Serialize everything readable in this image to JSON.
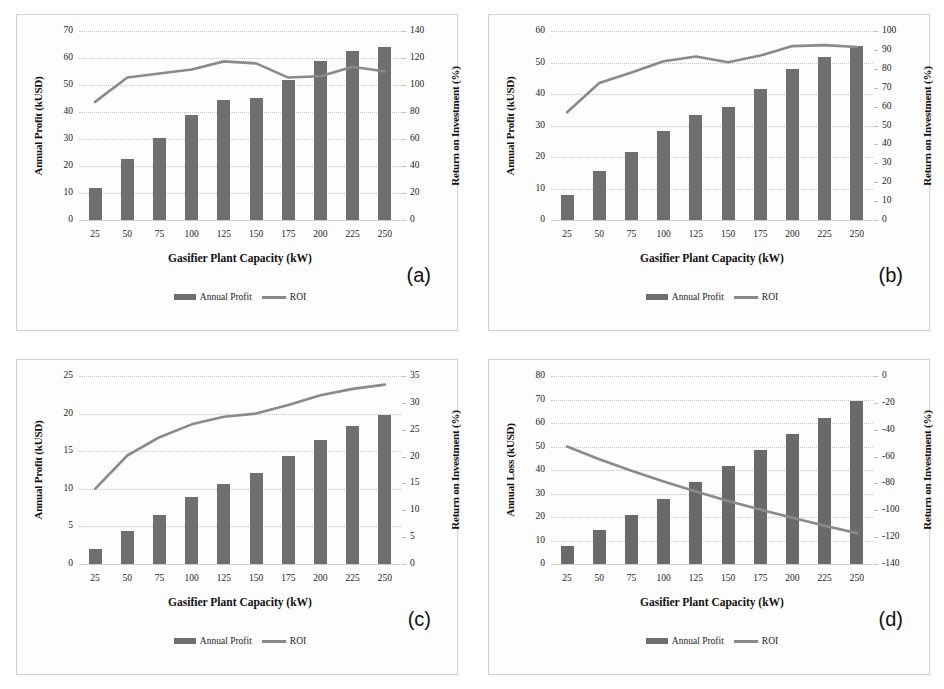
{
  "figure": {
    "categories": [
      "25",
      "50",
      "75",
      "100",
      "125",
      "150",
      "175",
      "200",
      "225",
      "250"
    ],
    "xlabel": "Gasifier Plant Capacity (kW)",
    "legend": {
      "bar": "Annual Profit",
      "line": "ROI"
    }
  },
  "chart_data": [
    {
      "type": "bar",
      "tag": "(a)",
      "title": "",
      "xlabel": "Gasifier Plant Capacity (kW)",
      "ylabel": "Annual Profit (kUSD)",
      "y2label": "Return on Investment (%)",
      "categories": [
        "25",
        "50",
        "75",
        "100",
        "125",
        "150",
        "175",
        "200",
        "225",
        "250"
      ],
      "ylim": [
        0,
        70
      ],
      "yticks": [
        "0",
        "10",
        "20",
        "30",
        "40",
        "50",
        "60",
        "70"
      ],
      "y2lim": [
        0,
        140
      ],
      "y2ticks": [
        "0",
        "20",
        "40",
        "60",
        "80",
        "100",
        "120",
        "140"
      ],
      "grid": true,
      "legend_position": "bottom-center",
      "series": [
        {
          "name": "Annual Profit",
          "kind": "bar",
          "axis": "left",
          "values": [
            12.0,
            22.5,
            30.5,
            39.0,
            44.5,
            45.3,
            52.0,
            59.0,
            62.6,
            64.0
          ]
        },
        {
          "name": "ROI",
          "kind": "line",
          "axis": "right",
          "values": [
            87.5,
            105.5,
            108.5,
            111.5,
            117.5,
            116.0,
            105.5,
            106.5,
            113.5,
            110.0
          ]
        }
      ]
    },
    {
      "type": "bar",
      "tag": "(b)",
      "title": "",
      "xlabel": "Gasifier Plant Capacity (kW)",
      "ylabel": "Annual Profit (kUSD)",
      "y2label": "Return on Investment (%)",
      "categories": [
        "25",
        "50",
        "75",
        "100",
        "125",
        "150",
        "175",
        "200",
        "225",
        "250"
      ],
      "ylim": [
        0,
        60
      ],
      "yticks": [
        "0",
        "10",
        "20",
        "30",
        "40",
        "50",
        "60"
      ],
      "y2lim": [
        0,
        100
      ],
      "y2ticks": [
        "0",
        "10",
        "20",
        "30",
        "40",
        "50",
        "60",
        "70",
        "80",
        "90",
        "100"
      ],
      "grid": true,
      "legend_position": "bottom-center",
      "series": [
        {
          "name": "Annual Profit",
          "kind": "bar",
          "axis": "left",
          "values": [
            8.0,
            15.5,
            21.5,
            28.3,
            33.2,
            36.0,
            41.5,
            47.8,
            51.6,
            55.2
          ]
        },
        {
          "name": "ROI",
          "kind": "line",
          "axis": "right",
          "values": [
            57.0,
            72.5,
            78.0,
            84.0,
            86.5,
            83.5,
            87.0,
            92.0,
            92.5,
            91.5
          ]
        }
      ]
    },
    {
      "type": "bar",
      "tag": "(c)",
      "title": "",
      "xlabel": "Gasifier Plant Capacity (kW)",
      "ylabel": "Annual Profit (kUSD)",
      "y2label": "Return on Investment (%)",
      "categories": [
        "25",
        "50",
        "75",
        "100",
        "125",
        "150",
        "175",
        "200",
        "225",
        "250"
      ],
      "ylim": [
        0,
        25
      ],
      "yticks": [
        "0",
        "5",
        "10",
        "15",
        "20",
        "25"
      ],
      "y2lim": [
        0,
        35
      ],
      "y2ticks": [
        "0",
        "5",
        "10",
        "15",
        "20",
        "25",
        "30",
        "35"
      ],
      "grid": true,
      "legend_position": "bottom-center",
      "series": [
        {
          "name": "Annual Profit",
          "kind": "bar",
          "axis": "left",
          "values": [
            2.0,
            4.4,
            6.5,
            8.9,
            10.7,
            12.1,
            14.3,
            16.5,
            18.4,
            19.8
          ]
        },
        {
          "name": "ROI",
          "kind": "line",
          "axis": "right",
          "values": [
            14.0,
            20.2,
            23.6,
            26.0,
            27.4,
            28.0,
            29.6,
            31.4,
            32.6,
            33.4
          ]
        }
      ]
    },
    {
      "type": "bar",
      "tag": "(d)",
      "title": "",
      "xlabel": "Gasifier Plant Capacity (kW)",
      "ylabel": "Annual Loss (kUSD)",
      "y2label": "Return on Investment (%)",
      "categories": [
        "25",
        "50",
        "75",
        "100",
        "125",
        "150",
        "175",
        "200",
        "225",
        "250"
      ],
      "ylim": [
        0,
        80
      ],
      "yticks": [
        "0",
        "10",
        "20",
        "30",
        "40",
        "50",
        "60",
        "70",
        "80"
      ],
      "y2lim": [
        -140,
        0
      ],
      "y2ticks": [
        "-140",
        "-120",
        "-100",
        "-80",
        "-60",
        "-40",
        "-20",
        "0"
      ],
      "grid": true,
      "legend_position": "bottom-center",
      "series": [
        {
          "name": "Annual Profit",
          "kind": "bar",
          "axis": "left",
          "values": [
            7.5,
            14.3,
            21.0,
            27.8,
            34.7,
            41.6,
            48.5,
            55.2,
            62.3,
            69.4
          ]
        },
        {
          "name": "ROI",
          "kind": "line",
          "axis": "right",
          "values": [
            -52.5,
            -62.0,
            -70.5,
            -78.5,
            -86.0,
            -93.0,
            -99.5,
            -105.5,
            -111.5,
            -117.0
          ]
        }
      ]
    }
  ],
  "colors": {
    "bar": "#6f6f6f",
    "line": "#8a8a8a",
    "grid": "#c9c9c9",
    "border": "#d2d2d2"
  }
}
